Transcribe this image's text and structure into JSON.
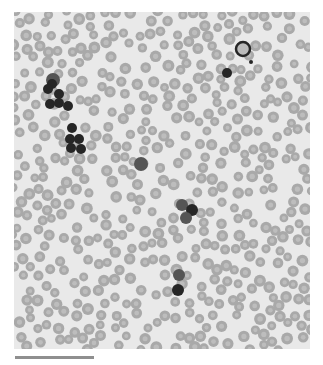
{
  "image": {
    "subject": "blood smear micrograph",
    "background_color": "#e9e9e9",
    "rbc_color": "#a9a9a9",
    "rbc_center_color": "#bdbdbd",
    "rbc_count": 520,
    "rbc_radius": 5.2,
    "dark_cell_color": "#262626",
    "grey_cell_color": "#555555",
    "dark_cells": [
      {
        "x": 39,
        "y": 68,
        "r": 7,
        "tone": "grey"
      },
      {
        "x": 38,
        "y": 72,
        "r": 5,
        "tone": "dark"
      },
      {
        "x": 34,
        "y": 77,
        "r": 5,
        "tone": "dark"
      },
      {
        "x": 45,
        "y": 82,
        "r": 5,
        "tone": "dark"
      },
      {
        "x": 36,
        "y": 92,
        "r": 5,
        "tone": "dark"
      },
      {
        "x": 45,
        "y": 91,
        "r": 5,
        "tone": "dark"
      },
      {
        "x": 54,
        "y": 94,
        "r": 5,
        "tone": "dark"
      },
      {
        "x": 58,
        "y": 116,
        "r": 5,
        "tone": "dark"
      },
      {
        "x": 56,
        "y": 127,
        "r": 5,
        "tone": "dark"
      },
      {
        "x": 65,
        "y": 127,
        "r": 5,
        "tone": "dark"
      },
      {
        "x": 57,
        "y": 136,
        "r": 5,
        "tone": "dark"
      },
      {
        "x": 67,
        "y": 137,
        "r": 5,
        "tone": "dark"
      },
      {
        "x": 229,
        "y": 37,
        "r": 7,
        "tone": "ring"
      },
      {
        "x": 237,
        "y": 50,
        "r": 2,
        "tone": "dark"
      },
      {
        "x": 213,
        "y": 61,
        "r": 5,
        "tone": "dark"
      },
      {
        "x": 127,
        "y": 152,
        "r": 7,
        "tone": "grey"
      },
      {
        "x": 168,
        "y": 193,
        "r": 6,
        "tone": "grey"
      },
      {
        "x": 178,
        "y": 198,
        "r": 6,
        "tone": "dark"
      },
      {
        "x": 172,
        "y": 206,
        "r": 6,
        "tone": "grey"
      },
      {
        "x": 165,
        "y": 263,
        "r": 6,
        "tone": "grey"
      },
      {
        "x": 164,
        "y": 278,
        "r": 6,
        "tone": "dark"
      }
    ]
  },
  "scale_bar": {
    "length_px": 79,
    "color": "#8f8f8f"
  }
}
